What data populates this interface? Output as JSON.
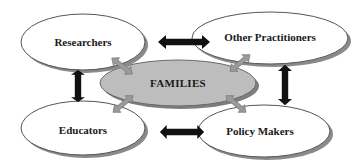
{
  "diagram": {
    "type": "stakeholder-relationship",
    "center": {
      "label": "FAMILIES",
      "fill": "#bdbdbd"
    },
    "nodes": [
      {
        "id": "researchers",
        "label": "Researchers"
      },
      {
        "id": "other_practitioners",
        "label": "Other Practitioners"
      },
      {
        "id": "educators",
        "label": "Educators"
      },
      {
        "id": "policy_makers",
        "label": "Policy Makers"
      }
    ],
    "connections": [
      {
        "from": "researchers",
        "to": "other_practitioners",
        "style": "black-double-arrow"
      },
      {
        "from": "educators",
        "to": "policy_makers",
        "style": "black-double-arrow"
      },
      {
        "from": "researchers",
        "to": "educators",
        "style": "black-double-arrow"
      },
      {
        "from": "other_practitioners",
        "to": "policy_makers",
        "style": "black-double-arrow"
      },
      {
        "from": "families",
        "to": "researchers",
        "style": "gray-double-arrow"
      },
      {
        "from": "families",
        "to": "other_practitioners",
        "style": "gray-double-arrow"
      },
      {
        "from": "families",
        "to": "educators",
        "style": "gray-double-arrow"
      },
      {
        "from": "families",
        "to": "policy_makers",
        "style": "gray-double-arrow"
      }
    ],
    "colors": {
      "node_fill": "#ffffff",
      "node_stroke": "#555555",
      "shadow": "#8a8a8a",
      "center_fill": "#bdbdbd",
      "black_arrow": "#111111",
      "gray_arrow": "#9a9a9a"
    }
  }
}
